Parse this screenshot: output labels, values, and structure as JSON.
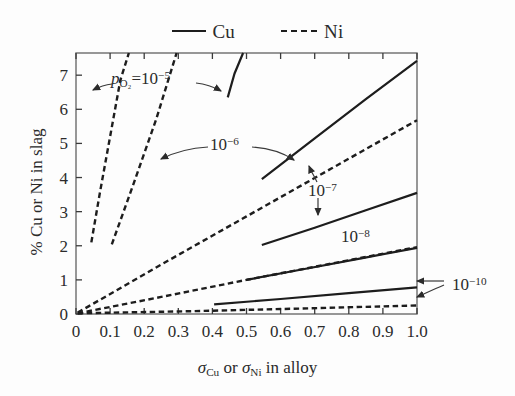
{
  "figure": {
    "background_color": "#fdfdfd",
    "line_color": "#1d1d1d"
  },
  "legend": {
    "position": "top-center",
    "entries": [
      {
        "label": "Cu",
        "style": "solid",
        "icon": "solid-line-swatch"
      },
      {
        "label": "Ni",
        "style": "dashed",
        "icon": "dashed-line-swatch"
      }
    ]
  },
  "axes": {
    "x_title_parts": {
      "sigma1": "σ",
      "sub1": "Cu",
      "mid": " or ",
      "sigma2": "σ",
      "sub2": "Ni",
      "tail": " in alloy"
    },
    "x_title_text": "σCu or σNi in alloy",
    "y_title_text": "% Cu or Ni in slag",
    "x_ticks": [
      "0",
      "0.1",
      "0.2",
      "0.3",
      "0.4",
      "0.5",
      "0.6",
      "0.7",
      "0.8",
      "0.9",
      "1.0"
    ],
    "x_tick_values": [
      0,
      0.1,
      0.2,
      0.3,
      0.4,
      0.5,
      0.6,
      0.7,
      0.8,
      0.9,
      1.0
    ],
    "y_ticks": [
      "0",
      "1",
      "2",
      "3",
      "4",
      "5",
      "6",
      "7"
    ],
    "y_tick_values": [
      0,
      1,
      2,
      3,
      4,
      5,
      6,
      7
    ],
    "xlim": [
      0,
      1.0
    ],
    "ylim": [
      0,
      7.65
    ],
    "grid": false
  },
  "annotations": [
    {
      "name": "po2-1e-5",
      "text": "pO2 = 10-5",
      "base": "p",
      "sub": "O₂",
      "eq": "=10",
      "exp": "−5",
      "x_px": 118,
      "y_px": 79,
      "arrows": [
        "left",
        "right"
      ]
    },
    {
      "name": "1e-6",
      "text": "10-6",
      "base": "10",
      "exp": "−6",
      "x_px": 219,
      "y_px": 143,
      "arrows": [
        "left",
        "right"
      ]
    },
    {
      "name": "1e-7",
      "text": "10-7",
      "base": "10",
      "exp": "−7",
      "x_px": 320,
      "y_px": 188,
      "arrows": [
        "up",
        "down"
      ]
    },
    {
      "name": "1e-8",
      "text": "10-8",
      "base": "10",
      "exp": "−8",
      "x_px": 350,
      "y_px": 234,
      "arrows": []
    },
    {
      "name": "1e-10",
      "text": "10-10",
      "base": "10",
      "exp": "−10",
      "x_px": 452,
      "y_px": 283,
      "arrows": [
        "left",
        "left"
      ]
    }
  ],
  "chart_data": {
    "type": "line",
    "title": "",
    "xlabel": "σCu or σNi in alloy",
    "ylabel": "% Cu or Ni in slag",
    "xlim": [
      0,
      1.0
    ],
    "ylim": [
      0,
      7.65
    ],
    "grid": false,
    "legend_position": "top-center",
    "annotation_labels": [
      "pO2 = 10−5",
      "10−6",
      "10−7",
      "10−8",
      "10−10"
    ],
    "series": [
      {
        "name": "Ni, pO2 = 10^-5",
        "element": "Ni",
        "po2": "1e-5",
        "style": "dashed",
        "x": [
          0.045,
          0.07,
          0.1,
          0.13,
          0.155
        ],
        "y": [
          2.1,
          3.55,
          5.2,
          6.85,
          7.65
        ]
      },
      {
        "name": "Cu, pO2 = 10^-5",
        "element": "Cu",
        "po2": "1e-5",
        "style": "solid",
        "x": [
          0.445,
          0.465,
          0.49
        ],
        "y": [
          6.35,
          7.05,
          7.65
        ]
      },
      {
        "name": "Ni, pO2 = 10^-6",
        "element": "Ni",
        "po2": "1e-6",
        "style": "dashed",
        "x": [
          0.105,
          0.17,
          0.235,
          0.295
        ],
        "y": [
          2.04,
          3.85,
          5.7,
          7.65
        ]
      },
      {
        "name": "Cu, pO2 = 10^-6",
        "element": "Cu",
        "po2": "1e-6",
        "style": "solid",
        "x": [
          0.545,
          0.7,
          0.85,
          1.0
        ],
        "y": [
          3.95,
          5.15,
          6.3,
          7.42
        ]
      },
      {
        "name": "Ni, pO2 = 10^-7",
        "element": "Ni",
        "po2": "1e-7",
        "style": "dashed",
        "x": [
          0.005,
          0.25,
          0.5,
          0.75,
          1.0
        ],
        "y": [
          0.04,
          1.45,
          2.86,
          4.27,
          5.68
        ]
      },
      {
        "name": "Cu, pO2 = 10^-7",
        "element": "Cu",
        "po2": "1e-7",
        "style": "solid",
        "x": [
          0.545,
          0.7,
          0.85,
          1.0
        ],
        "y": [
          2.02,
          2.53,
          3.04,
          3.55
        ]
      },
      {
        "name": "Ni, pO2 = 10^-8",
        "element": "Ni",
        "po2": "1e-8",
        "style": "dashed",
        "x": [
          0.005,
          0.25,
          0.5,
          0.75,
          1.0
        ],
        "y": [
          0.02,
          0.5,
          1.0,
          1.48,
          1.96
        ]
      },
      {
        "name": "Cu, pO2 = 10^-8",
        "element": "Cu",
        "po2": "1e-8",
        "style": "solid",
        "x": [
          0.5,
          0.67,
          0.84,
          1.0
        ],
        "y": [
          1.0,
          1.32,
          1.64,
          1.94
        ]
      },
      {
        "name": "Cu, pO2 = 10^-10",
        "element": "Cu",
        "po2": "1e-10",
        "style": "solid",
        "x": [
          0.405,
          0.6,
          0.8,
          1.0
        ],
        "y": [
          0.28,
          0.44,
          0.61,
          0.78
        ]
      },
      {
        "name": "Ni, pO2 = 10^-10",
        "element": "Ni",
        "po2": "1e-10",
        "style": "dashed",
        "x": [
          0.005,
          0.33,
          0.66,
          1.0
        ],
        "y": [
          0.02,
          0.08,
          0.16,
          0.25
        ]
      }
    ]
  }
}
